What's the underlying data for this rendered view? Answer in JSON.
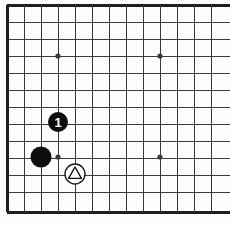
{
  "board": {
    "title": "Go board diagram",
    "type": "go-board-diagram",
    "background_color": "#fdfdfd",
    "line_color": "#3a3a3a",
    "border_color": "#1e1e1e",
    "black_stone_color": "#0d0d0d",
    "white_stone_color": "#ffffff",
    "white_stone_outline_color": "#1a1a1a",
    "grid_spacing_px": 17,
    "origin_x_px": 7,
    "origin_y_px": 5,
    "columns_visible": 13,
    "rows_visible": 13,
    "cropped_edges": [
      "right"
    ],
    "grid": {
      "vertical_lines_x": [
        7,
        24,
        41,
        58,
        75,
        92,
        109,
        126,
        143,
        160,
        177,
        194,
        211
      ],
      "horizontal_lines_y": [
        5,
        22,
        39,
        56,
        73,
        90,
        107,
        124,
        141,
        158,
        175,
        192,
        212
      ],
      "left_border_x": 7,
      "top_border_y": 5,
      "bottom_border_y": 212,
      "border_thickness_px": 3,
      "line_thickness_px": 1
    },
    "star_points": [
      {
        "name": "star-point-upper-left",
        "col": 3,
        "row": 3,
        "cx": 58,
        "cy": 56,
        "radius": 2.6
      },
      {
        "name": "star-point-upper-right",
        "col": 9,
        "row": 3,
        "cx": 160,
        "cy": 56,
        "radius": 2.6
      },
      {
        "name": "star-point-lower-left",
        "col": 3,
        "row": 9,
        "cx": 58,
        "cy": 157,
        "radius": 2.6
      },
      {
        "name": "star-point-lower-right",
        "col": 9,
        "row": 9,
        "cx": 160,
        "cy": 157,
        "radius": 2.6
      }
    ],
    "stones": [
      {
        "name": "black-stone-move-1",
        "color": "black",
        "cx": 58,
        "cy": 122,
        "radius": 10,
        "marker": "number",
        "label": "1",
        "label_color": "#ffffff"
      },
      {
        "name": "black-stone-plain",
        "color": "black",
        "cx": 41,
        "cy": 157,
        "radius": 10.5,
        "marker": "none",
        "label": "",
        "label_color": ""
      },
      {
        "name": "white-stone-triangle",
        "color": "white",
        "cx": 75,
        "cy": 174,
        "radius": 10,
        "marker": "triangle",
        "label": "",
        "label_color": "#111111"
      }
    ]
  }
}
